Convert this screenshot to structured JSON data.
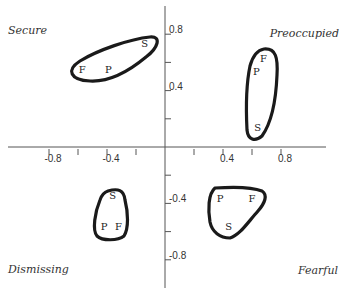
{
  "chart_data": {
    "type": "scatter",
    "title": "",
    "xlabel": "",
    "ylabel": "",
    "xlim": [
      -1.1,
      1.1
    ],
    "ylim": [
      -1.0,
      1.0
    ],
    "grid": false,
    "x_ticks": [
      -0.8,
      -0.6,
      -0.4,
      -0.2,
      0.2,
      0.4,
      0.6,
      0.8
    ],
    "x_tick_labels": [
      "-0.8",
      "",
      "-0.4",
      "",
      "",
      "0.4",
      "",
      "0.8"
    ],
    "y_ticks": [
      0.8,
      0.6,
      0.4,
      0.2,
      -0.2,
      -0.4,
      -0.6,
      -0.8
    ],
    "y_tick_labels": [
      "0.8",
      "",
      "0.4",
      "",
      "",
      "-0.4",
      "",
      "-0.8"
    ],
    "quadrant_labels": {
      "top_left": "Secure",
      "top_right": "Preoccupied",
      "bottom_left": "Dismissing",
      "bottom_right": "Fearful"
    },
    "clusters": [
      {
        "name": "Secure",
        "points": [
          {
            "label": "S",
            "x": -0.14,
            "y": 0.74
          },
          {
            "label": "F",
            "x": -0.57,
            "y": 0.55
          },
          {
            "label": "P",
            "x": -0.39,
            "y": 0.55
          }
        ]
      },
      {
        "name": "Preoccupied",
        "points": [
          {
            "label": "F",
            "x": 0.68,
            "y": 0.63
          },
          {
            "label": "P",
            "x": 0.63,
            "y": 0.54
          },
          {
            "label": "S",
            "x": 0.64,
            "y": 0.14
          }
        ]
      },
      {
        "name": "Dismissing",
        "points": [
          {
            "label": "S",
            "x": -0.36,
            "y": -0.34
          },
          {
            "label": "P",
            "x": -0.42,
            "y": -0.56
          },
          {
            "label": "F",
            "x": -0.32,
            "y": -0.56
          }
        ]
      },
      {
        "name": "Fearful",
        "points": [
          {
            "label": "P",
            "x": 0.38,
            "y": -0.36
          },
          {
            "label": "F",
            "x": 0.6,
            "y": -0.36
          },
          {
            "label": "S",
            "x": 0.44,
            "y": -0.56
          }
        ]
      }
    ],
    "legend": null,
    "colors": {
      "axis": "#555555",
      "outline": "#1a1a1a",
      "text": "#333333"
    }
  }
}
